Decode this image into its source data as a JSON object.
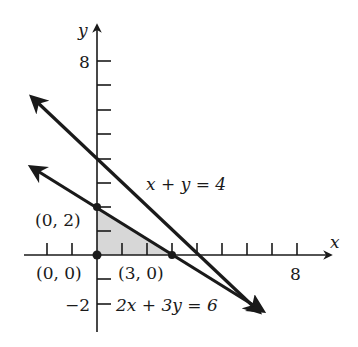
{
  "axes": {
    "x_label": "x",
    "y_label": "y",
    "x_tick_label": "8",
    "y_tick_top_label": "8",
    "y_tick_bottom_label": "−2"
  },
  "lines": [
    {
      "equation": "x + y = 4",
      "label": "x + y = 4"
    },
    {
      "equation": "2x + 3y = 6",
      "label": "2x + 3y = 6"
    }
  ],
  "points": [
    {
      "label": "(0, 2)",
      "x": 0,
      "y": 2
    },
    {
      "label": "(0, 0)",
      "x": 0,
      "y": 0
    },
    {
      "label": "(3, 0)",
      "x": 3,
      "y": 0
    }
  ],
  "region": {
    "description": "shaded feasible triangle",
    "vertices": [
      [
        0,
        0
      ],
      [
        0,
        2
      ],
      [
        3,
        0
      ]
    ],
    "color": "#d0d0d0"
  },
  "colors": {
    "ink": "#1a1a1a",
    "shade": "#d0d0d0"
  }
}
